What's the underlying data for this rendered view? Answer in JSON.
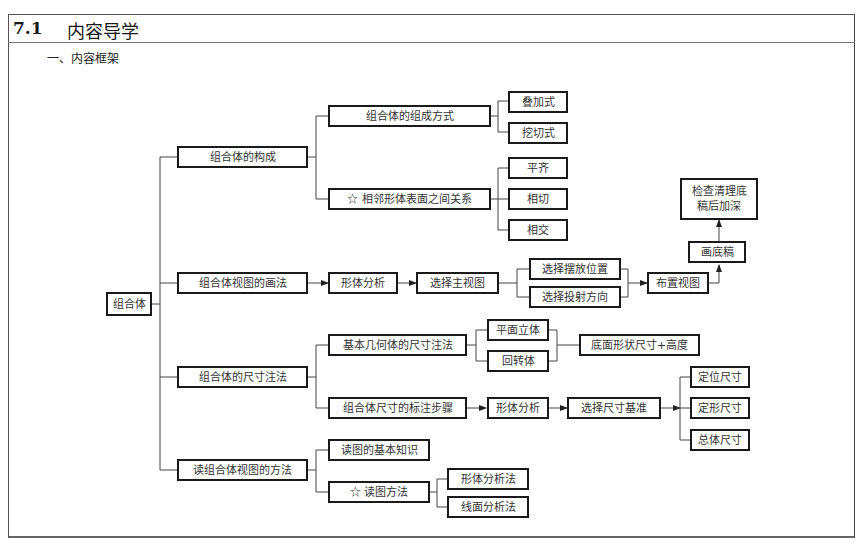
{
  "header": {
    "section_number": "7.1",
    "section_title": "内容导学"
  },
  "subheading": "一、内容框架",
  "diagram": {
    "root": "组合体",
    "branches": {
      "composition": {
        "label": "组合体的构成",
        "methods": {
          "label": "组合体的组成方式",
          "children": [
            "叠加式",
            "挖切式"
          ]
        },
        "surfaces": {
          "label": "☆ 相邻形体表面之间关系",
          "children": [
            "平齐",
            "相切",
            "相交"
          ]
        }
      },
      "drawing": {
        "label": "组合体视图的画法",
        "steps": [
          "形体分析",
          "选择主视图"
        ],
        "choices": [
          "选择摆放位置",
          "选择投射方向"
        ],
        "layout": "布置视图",
        "draft": "画底稿",
        "finish": "检查清理底稿后加深"
      },
      "dimensioning": {
        "label": "组合体的尺寸注法",
        "basic": {
          "label": "基本几何体的尺寸注法",
          "children": [
            "平面立体",
            "回转体"
          ],
          "result": "底面形状尺寸+高度"
        },
        "steps": {
          "label": "组合体尺寸的标注步骤",
          "sequence": [
            "形体分析",
            "选择尺寸基准"
          ],
          "children": [
            "定位尺寸",
            "定形尺寸",
            "总体尺寸"
          ]
        }
      },
      "reading": {
        "label": "读组合体视图的方法",
        "knowledge": "读图的基本知识",
        "methods": {
          "label": "☆ 读图方法",
          "children": [
            "形体分析法",
            "线面分析法"
          ]
        }
      }
    }
  }
}
